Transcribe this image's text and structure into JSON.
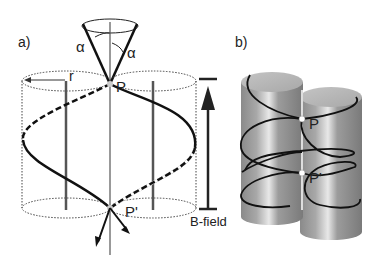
{
  "panel_a": {
    "label": "a)",
    "angle_left": "α",
    "angle_right": "α",
    "radius_label": "r",
    "point_top": "P",
    "point_bottom": "P'",
    "field_label": "B-field"
  },
  "panel_b": {
    "label": "b)",
    "point_top": "P",
    "point_bottom": "P'"
  },
  "colors": {
    "line": "#111111",
    "rod": "#555555",
    "dotted": "#444444",
    "cylinder_light": "#cfcfcf",
    "cylinder_mid": "#9a9a9a",
    "cylinder_dark": "#7d7d7d"
  }
}
